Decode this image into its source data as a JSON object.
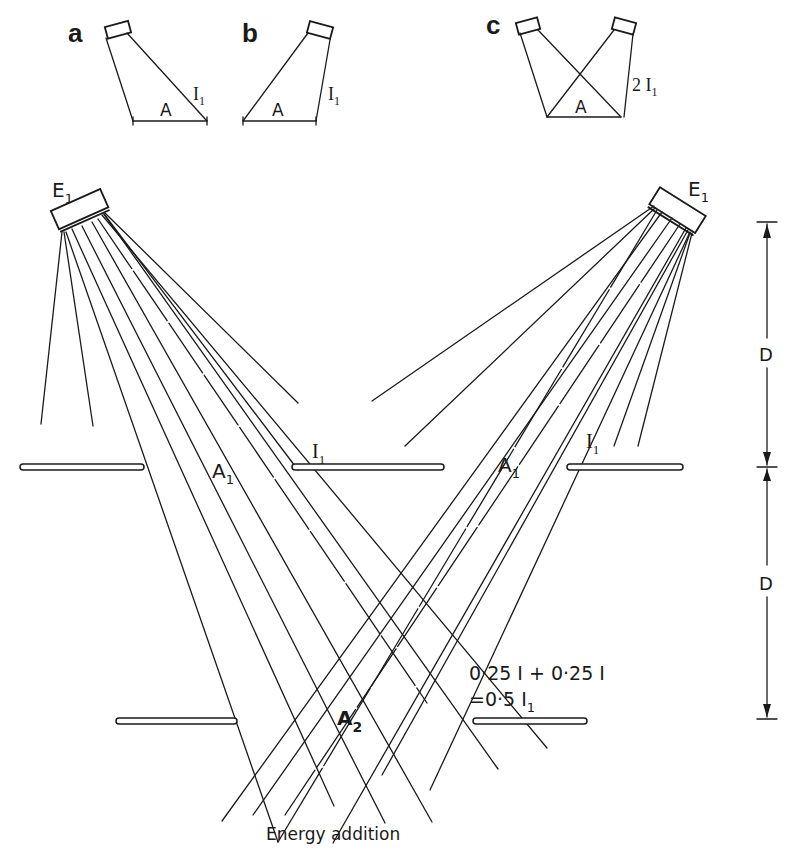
{
  "figure": {
    "type": "inverse-square / energy addition diagram",
    "caption": "Energy addition"
  },
  "insets": [
    {
      "panel_label": "a",
      "area_label": "A",
      "intensity_label": "I",
      "intensity_sub": "1"
    },
    {
      "panel_label": "b",
      "area_label": "A",
      "intensity_label": "I",
      "intensity_sub": "1"
    },
    {
      "panel_label": "c",
      "area_label": "A",
      "intensity_label": "2 I",
      "intensity_sub": "1"
    }
  ],
  "sources": [
    {
      "label": "E",
      "sub": "1",
      "position": "left"
    },
    {
      "label": "E",
      "sub": "1",
      "position": "right"
    }
  ],
  "labels": {
    "area_left_level1": {
      "main": "A",
      "sub": "1"
    },
    "area_right_level1": {
      "main": "A",
      "sub": "1"
    },
    "intensity_center_level1": {
      "main": "I",
      "sub": "1"
    },
    "intensity_right_level1": {
      "main": "I",
      "sub": "1"
    },
    "area_level2": {
      "main": "A",
      "sub": "2"
    },
    "equation_line1": "0·25 I + 0·25 I",
    "equation_line2_prefix": "=0·5 I",
    "equation_line2_sub": "1"
  },
  "dimensions": [
    {
      "label": "D",
      "segment": "source to first plane"
    },
    {
      "label": "D",
      "segment": "first plane to second plane"
    }
  ],
  "colors": {
    "ink": "#1a1a1a",
    "background": "#ffffff"
  }
}
